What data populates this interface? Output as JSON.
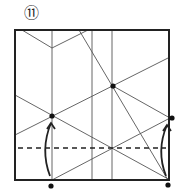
{
  "diagram": {
    "step_number": "⑪",
    "type": "origami-fold-step",
    "colors": {
      "line": "#222222",
      "crease": "#555555",
      "dot": "#111111"
    },
    "square": {
      "x": 15,
      "y": 30,
      "width": 154,
      "height": 150
    },
    "creases": [
      {
        "x1": 52,
        "y1": 30,
        "x2": 52,
        "y2": 180
      },
      {
        "x1": 92,
        "y1": 30,
        "x2": 92,
        "y2": 180
      },
      {
        "x1": 112,
        "y1": 30,
        "x2": 112,
        "y2": 180
      },
      {
        "x1": 22,
        "y1": 30,
        "x2": 52,
        "y2": 48
      },
      {
        "x1": 52,
        "y1": 48,
        "x2": 88,
        "y2": 30
      },
      {
        "x1": 79,
        "y1": 30,
        "x2": 168,
        "y2": 180
      },
      {
        "x1": 15,
        "y1": 135,
        "x2": 170,
        "y2": 57
      },
      {
        "x1": 15,
        "y1": 95,
        "x2": 170,
        "y2": 180
      },
      {
        "x1": 52,
        "y1": 180,
        "x2": 170,
        "y2": 118
      },
      {
        "x1": 113,
        "y1": 86,
        "x2": 170,
        "y2": 118
      }
    ],
    "dashed_fold": {
      "x1": 18,
      "y1": 148,
      "x2": 166,
      "y2": 148
    },
    "points": [
      {
        "x": 52,
        "y": 116
      },
      {
        "x": 113,
        "y": 86
      },
      {
        "x": 172,
        "y": 118
      },
      {
        "x": 51,
        "y": 186
      },
      {
        "x": 168,
        "y": 185
      }
    ],
    "arrows": [
      {
        "from": [
          50,
          176
        ],
        "to": [
          51,
          123
        ]
      },
      {
        "from": [
          166,
          176
        ],
        "to": [
          167,
          125
        ]
      }
    ]
  }
}
